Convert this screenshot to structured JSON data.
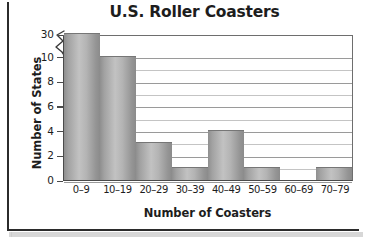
{
  "chart_data": {
    "type": "bar",
    "title": "U.S. Roller Coasters",
    "xlabel": "Number of Coasters",
    "ylabel": "Number of States",
    "categories": [
      "0–9",
      "10–19",
      "20–29",
      "30–39",
      "40–49",
      "50–59",
      "60–69",
      "70–79"
    ],
    "values": [
      30,
      10,
      3,
      1,
      4,
      1,
      0,
      1
    ],
    "ytick_labels": [
      "0",
      "2",
      "4",
      "6",
      "8",
      "10",
      "30"
    ],
    "ytick_values": [
      0,
      2,
      4,
      6,
      8,
      10,
      30
    ],
    "ylim": [
      0,
      30
    ],
    "axis_break": {
      "present": true,
      "between": [
        10,
        30
      ],
      "symbol": "zigzag"
    },
    "grid": "horizontal",
    "legend": "none",
    "bar_color": "#b0b0b0",
    "bar_edge_color": "#767676",
    "axis_color": "#4a4a4a",
    "text_color": "#1d1d1d",
    "background": "#ffffff"
  }
}
